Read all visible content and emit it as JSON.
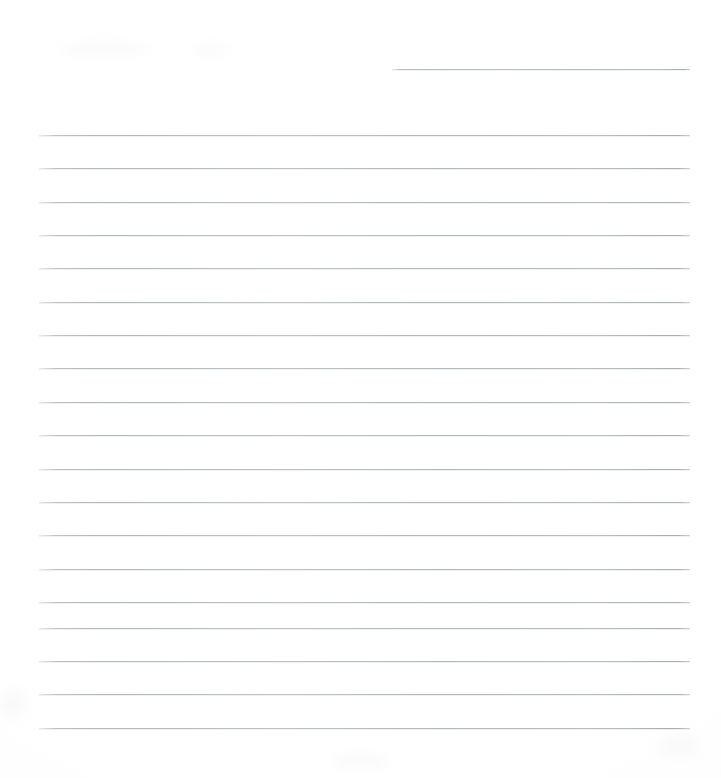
{
  "document": {
    "kind": "scanned-lined-paper",
    "title": "Blank ruled notepad page",
    "page_width": 721,
    "page_height": 778,
    "background_color": "#ffffff",
    "rule_color": "#b9bdc1",
    "text_content": "",
    "is_blank": "true"
  },
  "layout": {
    "rule_left": 39,
    "rule_right": 690,
    "rule_spacing": 33.3,
    "first_rule_y": 135,
    "last_rule_y": 728,
    "bottom_margin": 50,
    "top_margin": 55
  },
  "rules": {
    "header_rule": {
      "name": "date-line",
      "y": 69,
      "left": 392,
      "right": 690,
      "width": 298
    },
    "body_rules": [
      {
        "y": 135,
        "left": 39,
        "right": 690
      },
      {
        "y": 168,
        "left": 39,
        "right": 690
      },
      {
        "y": 202,
        "left": 39,
        "right": 690
      },
      {
        "y": 235,
        "left": 39,
        "right": 690
      },
      {
        "y": 268,
        "left": 39,
        "right": 690
      },
      {
        "y": 302,
        "left": 39,
        "right": 690
      },
      {
        "y": 335,
        "left": 39,
        "right": 690
      },
      {
        "y": 368,
        "left": 39,
        "right": 690
      },
      {
        "y": 402,
        "left": 39,
        "right": 690
      },
      {
        "y": 435,
        "left": 39,
        "right": 690
      },
      {
        "y": 469,
        "left": 39,
        "right": 690
      },
      {
        "y": 502,
        "left": 39,
        "right": 690
      },
      {
        "y": 535,
        "left": 39,
        "right": 690
      },
      {
        "y": 569,
        "left": 39,
        "right": 690
      },
      {
        "y": 602,
        "left": 39,
        "right": 690
      },
      {
        "y": 628,
        "left": 39,
        "right": 690
      },
      {
        "y": 661,
        "left": 39,
        "right": 690
      },
      {
        "y": 694,
        "left": 39,
        "right": 690
      },
      {
        "y": 728,
        "left": 39,
        "right": 690
      }
    ]
  },
  "blemishes": [
    {
      "x": 60,
      "y": 44,
      "w": 90,
      "h": 10
    },
    {
      "x": 190,
      "y": 46,
      "w": 40,
      "h": 8
    },
    {
      "x": 0,
      "y": 690,
      "w": 26,
      "h": 26
    },
    {
      "x": 330,
      "y": 756,
      "w": 60,
      "h": 12
    },
    {
      "x": 660,
      "y": 735,
      "w": 38,
      "h": 22
    }
  ]
}
